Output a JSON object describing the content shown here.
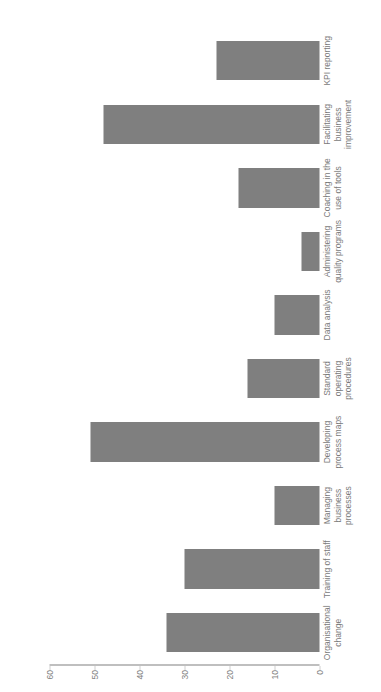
{
  "chart_data": {
    "type": "bar",
    "title": "",
    "subtitle": "",
    "xlabel": "",
    "ylabel": "",
    "orientation": "vertical",
    "rotation_note": "entire figure rendered rotated 90 degrees counter-clockwise",
    "grid": false,
    "legend": null,
    "ylim": [
      0,
      60
    ],
    "yticks": [
      0,
      10,
      20,
      30,
      40,
      50,
      60
    ],
    "ytick_labels": [
      "0",
      "10",
      "20",
      "30",
      "40",
      "50",
      "60"
    ],
    "bar_color": "#7f7f7f",
    "axis_color": "#bfbfbf",
    "text_color": "#7a7a7a",
    "categories": [
      "Organisational\nchange",
      "Training of staff",
      "Managing\nbusiness\nprocesses",
      "Developing\nprocess maps",
      "Standard\noperating\nprocedures",
      "Data analysis",
      "Administering\nquality programs",
      "Coaching in the\nuse of tools",
      "Facilitating\nbusiness\nimprovement",
      "KPI reporting"
    ],
    "values": [
      34,
      30,
      10,
      51,
      16,
      10,
      4,
      18,
      48,
      23
    ]
  }
}
